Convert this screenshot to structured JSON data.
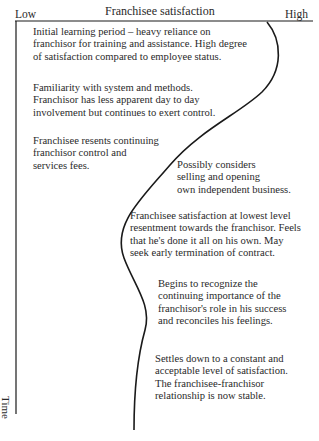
{
  "diagram": {
    "axes": {
      "x_title": "Franchisee satisfaction",
      "x_low": "Low",
      "x_high": "High",
      "y_title": "Time"
    },
    "notes": [
      {
        "lines": [
          "Initial learning period – heavy reliance on",
          "franchisor for training and assistance. High degree",
          "of satisfaction compared to employee status."
        ]
      },
      {
        "lines": [
          "Familiarity with system and methods.",
          "Franchisor has less apparent day  to day",
          "involvement but continues to exert control."
        ]
      },
      {
        "lines": [
          "Franchisee resents continuing",
          "franchisor control and",
          "services fees."
        ]
      },
      {
        "lines": [
          "Possibly considers",
          "selling and opening",
          "own independent business."
        ]
      },
      {
        "lines": [
          "Franchisee satisfaction at lowest level",
          "resentment towards the franchisor. Feels",
          "that he's done it all on his own. May",
          "seek early termination of contract."
        ]
      },
      {
        "lines": [
          "Begins to recognize the",
          "continuing importance of the",
          "franchisor's role in his success",
          "and reconciles his feelings."
        ]
      },
      {
        "lines": [
          "Settles down to a constant and",
          "acceptable level of satisfaction.",
          "The franchisee-franchisor",
          "relationship is now stable."
        ]
      }
    ],
    "colors": {
      "line": "#1a1a1a",
      "text": "#2a2a2a",
      "background": "#ffffff"
    }
  }
}
